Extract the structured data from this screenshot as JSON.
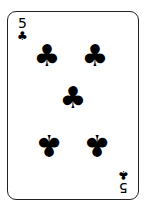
{
  "card": {
    "rank": "5",
    "suit": "clubs",
    "suit_glyph": "♣",
    "color": "#000000",
    "pips": [
      {
        "x": 39,
        "y": 44,
        "inverted": false
      },
      {
        "x": 87,
        "y": 44,
        "inverted": false
      },
      {
        "x": 65,
        "y": 86,
        "inverted": false
      },
      {
        "x": 41,
        "y": 133,
        "inverted": true
      },
      {
        "x": 89,
        "y": 133,
        "inverted": true
      }
    ]
  }
}
